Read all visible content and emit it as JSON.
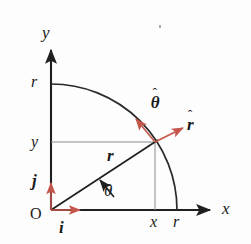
{
  "figure": {
    "colors": {
      "axis": "#1f1f1f",
      "arc": "#1f1f1f",
      "guide": "#8a8a8a",
      "unit_vector_red": "#c4564b",
      "text": "#1a1a1a",
      "background": "#fdfdfd"
    }
  },
  "labels": {
    "y_axis": "y",
    "x_axis": "x",
    "origin": "O",
    "tick_r_on_y": "r",
    "tick_y_on_y": "y",
    "tick_x_on_x": "x",
    "tick_r_on_x": "r",
    "position_vector": "r",
    "angle": "θ",
    "unit_i": "i",
    "unit_j": "j",
    "unit_r_base": "r",
    "unit_theta_base": "θ",
    "hat": "ˆ"
  },
  "geometry": {
    "origin": {
      "x": 51,
      "y": 210
    },
    "radius": 126,
    "point": {
      "x": 155,
      "y": 142
    },
    "y_axis_tip": {
      "x": 51,
      "y": 44
    },
    "x_axis_tip": {
      "x": 216,
      "y": 210
    },
    "arc_start": {
      "x": 51,
      "y": 85
    },
    "arc_end": {
      "x": 178,
      "y": 210
    },
    "angle_degrees": 33,
    "unit_i_tip": {
      "x": 83,
      "y": 210
    },
    "unit_j_tip": {
      "x": 51,
      "y": 180
    },
    "unit_r_tip": {
      "x": 187,
      "y": 125
    },
    "unit_theta_tip": {
      "x": 133,
      "y": 116
    }
  }
}
